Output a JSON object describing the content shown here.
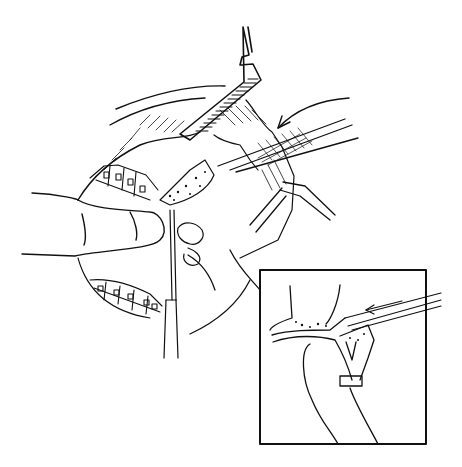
{
  "figure": {
    "description": "Line illustration of intraoral surgical procedure with retractors, instruments and orthodontic brackets; inset shows cross-section detail",
    "colors": {
      "ink": "#111111",
      "paper": "#ffffff"
    },
    "inset": {
      "x": 260,
      "y": 270,
      "width": 166,
      "height": 174
    },
    "elements": [
      "upper-retractor",
      "curved-arrow",
      "elevator-instrument",
      "lower-retractor",
      "operator-finger",
      "orthodontic-brackets-upper",
      "orthodontic-brackets-lower",
      "vertical-probe",
      "inset-frame",
      "inset-bone-section",
      "inset-finger",
      "inset-instrument-arrow"
    ]
  }
}
